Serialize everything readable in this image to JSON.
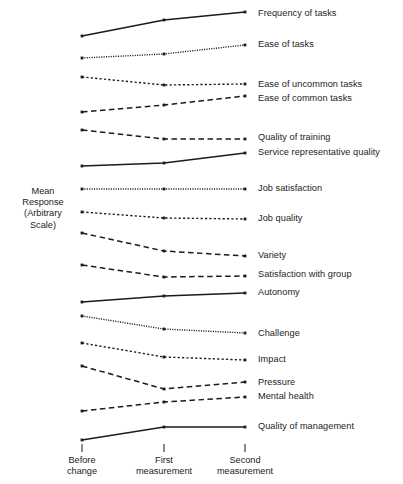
{
  "chart_data": {
    "type": "line",
    "title": "",
    "xlabel": "",
    "ylabel": "Mean Response (Arbitrary Scale)",
    "ylabel_lines": [
      "Mean",
      "Response",
      "(Arbitrary",
      "Scale)"
    ],
    "categories": [
      "Before change",
      "First measurement",
      "Second measurement"
    ],
    "category_lines": [
      [
        "Before",
        "change"
      ],
      [
        "First",
        "measurement"
      ],
      [
        "Second",
        "measurement"
      ]
    ],
    "grid": false,
    "legend_position": "right-inline",
    "axis_note": "Arbitrary vertically-offset scale; each series drawn on its own baseline, y values are pixel rows from top",
    "x_pixels": [
      82,
      164,
      245
    ],
    "series": [
      {
        "name": "Frequency of tasks",
        "style": "solid",
        "values": [
          36,
          20,
          12
        ],
        "label_y": 14
      },
      {
        "name": "Ease of tasks",
        "style": "dotted",
        "values": [
          58,
          54,
          45
        ],
        "label_y": 45
      },
      {
        "name": "Ease of uncommon tasks",
        "style": "fine-dotted",
        "values": [
          77,
          85,
          84
        ],
        "label_y": 85
      },
      {
        "name": "Ease of common tasks",
        "style": "dashed",
        "values": [
          112,
          105,
          96
        ],
        "label_y": 99
      },
      {
        "name": "Quality of training",
        "style": "dashed",
        "values": [
          130,
          139,
          139
        ],
        "label_y": 138
      },
      {
        "name": "Service representative quality",
        "style": "solid",
        "values": [
          166,
          163,
          153
        ],
        "label_y": 153
      },
      {
        "name": "Job satisfaction",
        "style": "dotted",
        "values": [
          189,
          189,
          189
        ],
        "label_y": 189
      },
      {
        "name": "Job quality",
        "style": "fine-dotted",
        "values": [
          212,
          218,
          219
        ],
        "label_y": 219
      },
      {
        "name": "Variety",
        "style": "dashed",
        "values": [
          233,
          251,
          256
        ],
        "label_y": 256
      },
      {
        "name": "Satisfaction with group",
        "style": "dashed",
        "values": [
          265,
          277,
          276
        ],
        "label_y": 275
      },
      {
        "name": "Autonomy",
        "style": "solid",
        "values": [
          302,
          296,
          293
        ],
        "label_y": 293
      },
      {
        "name": "Challenge",
        "style": "dotted",
        "values": [
          316,
          329,
          333
        ],
        "label_y": 334
      },
      {
        "name": "Impact",
        "style": "fine-dotted",
        "values": [
          343,
          357,
          360
        ],
        "label_y": 360
      },
      {
        "name": "Pressure",
        "style": "dashed",
        "values": [
          366,
          389,
          382
        ],
        "label_y": 383
      },
      {
        "name": "Mental health",
        "style": "dashed",
        "values": [
          411,
          402,
          397
        ],
        "label_y": 397
      },
      {
        "name": "Quality of management",
        "style": "solid",
        "values": [
          440,
          427,
          427
        ],
        "label_y": 427
      }
    ]
  },
  "axis": {
    "tick_y_top": 444,
    "tick_y_bottom": 452,
    "tick_label_y": 455,
    "label_x": 258
  },
  "colors": {
    "ink": "#1b1b1b",
    "background": "#ffffff"
  }
}
